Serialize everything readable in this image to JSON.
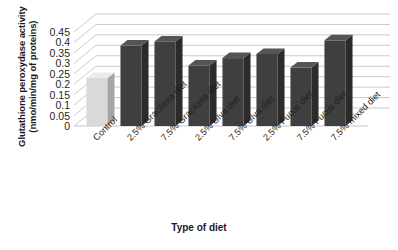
{
  "chart_data": {
    "type": "bar",
    "title": "",
    "subtitle": "",
    "xlabel": "Type of diet",
    "ylabel": "Glutathione peroxydase activity (nmo/min/mg of proteins)",
    "ylabel_line1": "Glutathione peroxydase activity",
    "ylabel_line2": "(nmo/min/mg of proteins)",
    "categories": [
      "Control",
      "2.5% Gracilaria diet",
      "7.5% Gracilaria diet",
      "2.5% Ulva diet",
      "7.5% Ulva diet",
      "2.5% Fucus diet",
      "7.5% Fucus diet",
      "7.5% mixed diet"
    ],
    "values": [
      0.23,
      0.385,
      0.405,
      0.29,
      0.325,
      0.345,
      0.28,
      0.41
    ],
    "ylim": [
      0,
      0.45
    ],
    "yticks": [
      0,
      0.05,
      0.1,
      0.15,
      0.2,
      0.25,
      0.3,
      0.35,
      0.4,
      0.45
    ],
    "ytick_labels": [
      "0",
      "0.05",
      "0.1",
      "0.15",
      "0.2",
      "0.25",
      "0.3",
      "0.35",
      "0.4",
      "0.45"
    ],
    "grid": true,
    "legend": false,
    "legend_position": "none",
    "style": "3d-column",
    "bar_colors": [
      "#d9d9d9",
      "#3f3f3f",
      "#3f3f3f",
      "#3f3f3f",
      "#3f3f3f",
      "#3f3f3f",
      "#3f3f3f",
      "#3f3f3f"
    ],
    "bar_side_colors": [
      "#a6a6a6",
      "#2b2b2b",
      "#2b2b2b",
      "#2b2b2b",
      "#2b2b2b",
      "#2b2b2b",
      "#2b2b2b",
      "#2b2b2b"
    ],
    "bar_top_colors": [
      "#ececec",
      "#555555",
      "#555555",
      "#555555",
      "#555555",
      "#555555",
      "#555555",
      "#555555"
    ],
    "gridline_color": "#c4c4c4",
    "background_color": "#ffffff",
    "text_color": "#1a1a1a"
  }
}
